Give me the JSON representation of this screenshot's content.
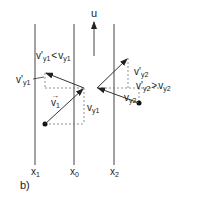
{
  "figure": {
    "panel_label": "b)",
    "velocity_arrow_label": "u",
    "axis_labels": {
      "x1": {
        "main": "x",
        "sub": "1"
      },
      "x0": {
        "main": "x",
        "sub": "0"
      },
      "x2": {
        "main": "x",
        "sub": "2"
      }
    },
    "left_particle": {
      "incident_vector": {
        "main": "v",
        "sub": "1",
        "arrow": "→"
      },
      "vy": {
        "main": "v",
        "sub": "y1"
      },
      "vy_prime": {
        "main": "v'",
        "sub": "y1"
      },
      "relation": {
        "lhs_main": "v'",
        "lhs_sub": "y1",
        "op": "<",
        "rhs_main": "v",
        "rhs_sub": "y1"
      }
    },
    "right_particle": {
      "vy": {
        "main": "v",
        "sub": "y2"
      },
      "vy_prime": {
        "main": "v'",
        "sub": "y2"
      },
      "relation": {
        "lhs_main": "v'",
        "lhs_sub": "y2",
        "op": ">",
        "rhs_main": "v",
        "rhs_sub": "y2"
      }
    },
    "colors": {
      "line": "#333333",
      "dashed": "#666666",
      "text": "#222222"
    }
  }
}
